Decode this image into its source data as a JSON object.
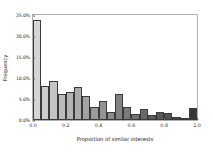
{
  "chart_data": {
    "type": "bar",
    "title": "",
    "xlabel": "Proportion of similar interests",
    "ylabel": "Frequency",
    "xlim": [
      0.0,
      1.0
    ],
    "ylim": [
      0.0,
      25.0
    ],
    "grid": false,
    "legend": null,
    "bin_width": 0.05,
    "categories": [
      "0.00",
      "0.05",
      "0.10",
      "0.15",
      "0.20",
      "0.25",
      "0.30",
      "0.35",
      "0.40",
      "0.45",
      "0.50",
      "0.55",
      "0.60",
      "0.65",
      "0.70",
      "0.75",
      "0.80",
      "0.85",
      "0.90",
      "0.95"
    ],
    "values": [
      23.8,
      8.1,
      9.3,
      6.3,
      6.6,
      7.8,
      5.7,
      3.0,
      4.5,
      1.8,
      6.2,
      3.1,
      1.5,
      2.6,
      1.1,
      1.9,
      1.6,
      0.8,
      0.4,
      2.9
    ],
    "bar_colors": [
      "#d5d5d5",
      "#cccccc",
      "#c4c4c4",
      "#bcbcbc",
      "#b4b4b4",
      "#ababab",
      "#a3a3a3",
      "#9b9b9b",
      "#939393",
      "#8a8a8a",
      "#828282",
      "#7a7a7a",
      "#727272",
      "#696969",
      "#616161",
      "#595959",
      "#515151",
      "#484848",
      "#404040",
      "#383838"
    ],
    "xticks": [
      "0.0",
      "0.2",
      "0.4",
      "0.6",
      "0.8",
      "1.0"
    ],
    "xtick_values": [
      0.0,
      0.2,
      0.4,
      0.6,
      0.8,
      1.0
    ],
    "yticks": [
      "0.0%",
      "5.0%",
      "10.0%",
      "15.0%",
      "20.0%",
      "25.0%"
    ],
    "ytick_values": [
      0.0,
      5.0,
      10.0,
      15.0,
      20.0,
      25.0
    ],
    "axis_color": "#b0b0b0",
    "bar_edge_color": "#3a3a3a",
    "background_color": "#ffffff"
  }
}
